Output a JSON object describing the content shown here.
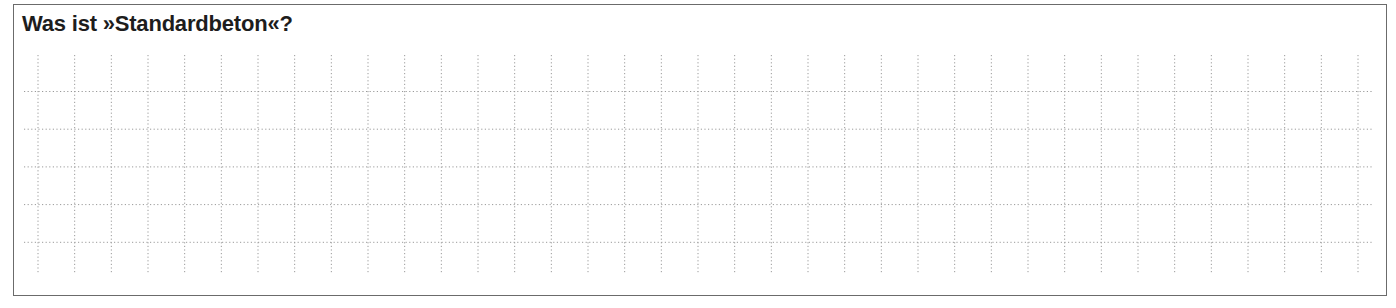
{
  "worksheet": {
    "question": "Was ist »Standardbeton«?",
    "answer_area": {
      "type": "dotted-grid",
      "columns": 37,
      "rows": 5,
      "line_color": "#9a9a9a",
      "value": ""
    }
  }
}
